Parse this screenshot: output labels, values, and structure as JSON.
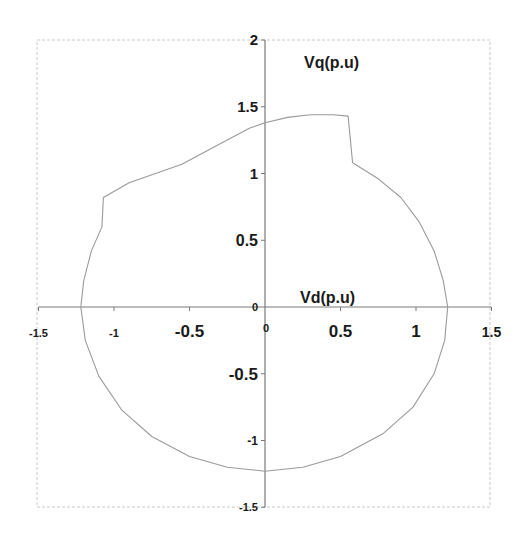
{
  "chart_data": {
    "type": "line",
    "title": "",
    "xlabel": "Vd(p.u)",
    "ylabel": "Vq(p.u)",
    "xlim": [
      -1.5,
      1.5
    ],
    "ylim": [
      -1.5,
      2
    ],
    "grid": false,
    "legend": null,
    "x_ticks": [
      {
        "value": -1.5,
        "label": "-1.5",
        "size": 11
      },
      {
        "value": -1,
        "label": "-1",
        "size": 11
      },
      {
        "value": -0.5,
        "label": "-0.5",
        "size": 17
      },
      {
        "value": 0,
        "label": "0",
        "size": 11
      },
      {
        "value": 0.5,
        "label": "0.5",
        "size": 17
      },
      {
        "value": 1,
        "label": "1",
        "size": 17
      },
      {
        "value": 1.5,
        "label": "1.5",
        "size": 14
      }
    ],
    "y_ticks": [
      {
        "value": 2,
        "label": "2",
        "size": 15
      },
      {
        "value": 1.5,
        "label": "1.5",
        "size": 15
      },
      {
        "value": 1,
        "label": "1",
        "size": 15
      },
      {
        "value": 0.5,
        "label": "0.5",
        "size": 16
      },
      {
        "value": 0,
        "label": "0",
        "size": 11
      },
      {
        "value": -0.5,
        "label": "-0.5",
        "size": 17
      },
      {
        "value": -1,
        "label": "-1",
        "size": 12
      },
      {
        "value": -1.5,
        "label": "-1.5",
        "size": 11
      }
    ],
    "series": [
      {
        "name": "voltage trajectory",
        "color": "#9a9a9a",
        "points": [
          [
            0.58,
            1.08
          ],
          [
            0.75,
            0.96
          ],
          [
            0.9,
            0.82
          ],
          [
            1.02,
            0.64
          ],
          [
            1.12,
            0.42
          ],
          [
            1.18,
            0.2
          ],
          [
            1.21,
            0.0
          ],
          [
            1.19,
            -0.25
          ],
          [
            1.12,
            -0.5
          ],
          [
            0.98,
            -0.75
          ],
          [
            0.78,
            -0.95
          ],
          [
            0.5,
            -1.12
          ],
          [
            0.25,
            -1.2
          ],
          [
            0.0,
            -1.23
          ],
          [
            -0.25,
            -1.2
          ],
          [
            -0.5,
            -1.12
          ],
          [
            -0.75,
            -0.97
          ],
          [
            -0.95,
            -0.77
          ],
          [
            -1.1,
            -0.52
          ],
          [
            -1.19,
            -0.25
          ],
          [
            -1.22,
            0.0
          ],
          [
            -1.2,
            0.2
          ],
          [
            -1.15,
            0.42
          ],
          [
            -1.08,
            0.6
          ],
          [
            -1.07,
            0.82
          ],
          [
            -0.9,
            0.93
          ],
          [
            -0.55,
            1.07
          ],
          [
            -0.3,
            1.22
          ],
          [
            -0.1,
            1.34
          ],
          [
            0.0,
            1.38
          ],
          [
            0.15,
            1.42
          ],
          [
            0.3,
            1.44
          ],
          [
            0.45,
            1.44
          ],
          [
            0.55,
            1.43
          ],
          [
            0.58,
            1.08
          ]
        ]
      }
    ]
  }
}
